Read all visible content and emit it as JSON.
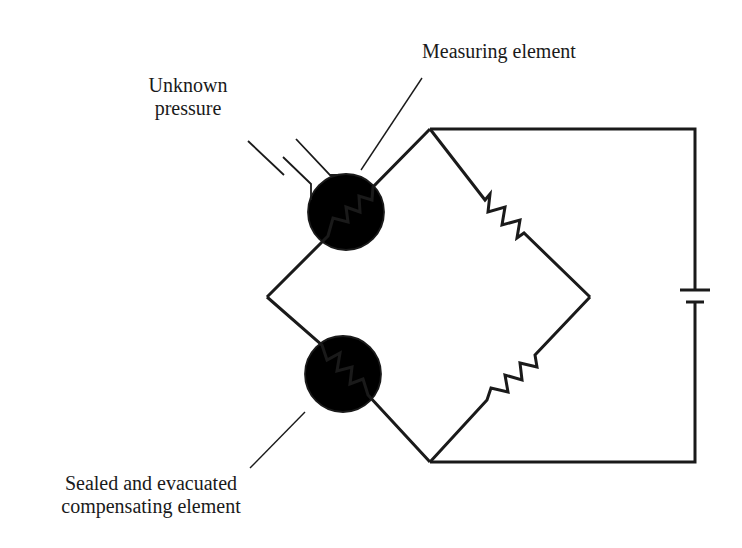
{
  "diagram": {
    "type": "Wheatstone bridge pressure gauge (Pirani/thermal conductivity gauge)",
    "colors": {
      "line": "#1a1a1a",
      "background": "#ffffff"
    },
    "labels": {
      "measuring_element": "Measuring element",
      "unknown_pressure_line1": "Unknown",
      "unknown_pressure_line2": "pressure",
      "compensating_line1": "Sealed and evacuated",
      "compensating_line2": "compensating element"
    },
    "components": [
      {
        "id": "measuring-element",
        "kind": "resistor-in-envelope",
        "note": "open port to unknown pressure"
      },
      {
        "id": "compensating-element",
        "kind": "resistor-in-envelope",
        "note": "sealed and evacuated"
      },
      {
        "id": "fixed-resistor-upper",
        "kind": "resistor"
      },
      {
        "id": "fixed-resistor-lower",
        "kind": "resistor"
      },
      {
        "id": "battery",
        "kind": "dc-source"
      }
    ]
  }
}
